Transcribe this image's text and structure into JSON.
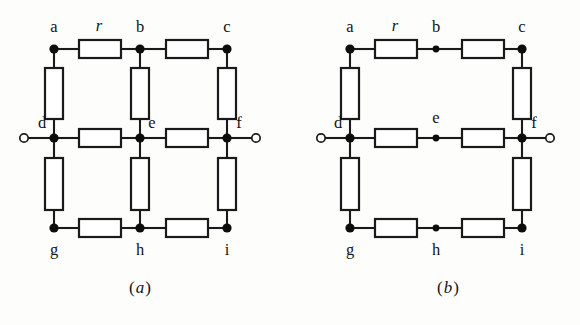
{
  "figure": {
    "background_color": "#fdfdfb",
    "line_color": "#1a1a1a",
    "resistor_fill": "#ffffff",
    "node_color": "#0d0d0d"
  },
  "resistor_label": "r",
  "panels": [
    {
      "id": "a",
      "caption_open": "(",
      "caption_letter": "a",
      "caption_close": ")",
      "description": "Nine-node resistor grid with all twelve resistors present, terminals at d and f",
      "node_labels": [
        "a",
        "b",
        "c",
        "d",
        "e",
        "f",
        "g",
        "h",
        "i"
      ],
      "nodes": [
        {
          "name": "a",
          "label": "a",
          "x": 54,
          "y": 49,
          "label_x": 54,
          "label_y": 32,
          "dot_r": 4.6
        },
        {
          "name": "b",
          "label": "b",
          "x": 140,
          "y": 49,
          "label_x": 140,
          "label_y": 32,
          "dot_r": 4.6
        },
        {
          "name": "c",
          "label": "c",
          "x": 227,
          "y": 49,
          "label_x": 227,
          "label_y": 32,
          "dot_r": 4.6
        },
        {
          "name": "d",
          "label": "d",
          "x": 54,
          "y": 138,
          "label_x": 42,
          "label_y": 128,
          "dot_r": 4.6
        },
        {
          "name": "e",
          "label": "e",
          "x": 140,
          "y": 138,
          "label_x": 152,
          "label_y": 128,
          "dot_r": 4.6
        },
        {
          "name": "f",
          "label": "f",
          "x": 227,
          "y": 138,
          "label_x": 239,
          "label_y": 128,
          "dot_r": 4.6
        },
        {
          "name": "g",
          "label": "g",
          "x": 54,
          "y": 228,
          "label_x": 54,
          "label_y": 255,
          "dot_r": 4.6
        },
        {
          "name": "h",
          "label": "h",
          "x": 140,
          "y": 228,
          "label_x": 140,
          "label_y": 255,
          "dot_r": 4.6
        },
        {
          "name": "i",
          "label": "i",
          "x": 227,
          "y": 228,
          "label_x": 227,
          "label_y": 255,
          "dot_r": 4.6
        }
      ],
      "resistors": [
        {
          "name": "resistor-a-b",
          "orientation": "h",
          "x": 79,
          "y": 40,
          "w": 42,
          "h": 18,
          "labeled": true
        },
        {
          "name": "resistor-b-c",
          "orientation": "h",
          "x": 166,
          "y": 40,
          "w": 42,
          "h": 18,
          "labeled": false
        },
        {
          "name": "resistor-d-e",
          "orientation": "h",
          "x": 79,
          "y": 129,
          "w": 42,
          "h": 18,
          "labeled": false
        },
        {
          "name": "resistor-e-f",
          "orientation": "h",
          "x": 166,
          "y": 129,
          "w": 42,
          "h": 18,
          "labeled": false
        },
        {
          "name": "resistor-g-h",
          "orientation": "h",
          "x": 79,
          "y": 219,
          "w": 42,
          "h": 18,
          "labeled": false
        },
        {
          "name": "resistor-h-i",
          "orientation": "h",
          "x": 166,
          "y": 219,
          "w": 42,
          "h": 18,
          "labeled": false
        },
        {
          "name": "resistor-a-d",
          "orientation": "v",
          "x": 45,
          "y": 68,
          "w": 18,
          "h": 51,
          "labeled": false
        },
        {
          "name": "resistor-b-e",
          "orientation": "v",
          "x": 131,
          "y": 68,
          "w": 18,
          "h": 51,
          "labeled": false
        },
        {
          "name": "resistor-c-f",
          "orientation": "v",
          "x": 218,
          "y": 68,
          "w": 18,
          "h": 51,
          "labeled": false
        },
        {
          "name": "resistor-d-g",
          "orientation": "v",
          "x": 45,
          "y": 158,
          "w": 18,
          "h": 52,
          "labeled": false
        },
        {
          "name": "resistor-e-h",
          "orientation": "v",
          "x": 131,
          "y": 158,
          "w": 18,
          "h": 52,
          "labeled": false
        },
        {
          "name": "resistor-f-i",
          "orientation": "v",
          "x": 218,
          "y": 158,
          "w": 18,
          "h": 52,
          "labeled": false
        }
      ],
      "wires": [
        {
          "name": "wire-a-to-res-ab",
          "x1": 54,
          "y1": 49,
          "x2": 79,
          "y2": 49
        },
        {
          "name": "wire-res-ab-to-b",
          "x1": 121,
          "y1": 49,
          "x2": 140,
          "y2": 49
        },
        {
          "name": "wire-b-to-res-bc",
          "x1": 140,
          "y1": 49,
          "x2": 166,
          "y2": 49
        },
        {
          "name": "wire-res-bc-to-c",
          "x1": 208,
          "y1": 49,
          "x2": 227,
          "y2": 49
        },
        {
          "name": "wire-d-to-res-de",
          "x1": 54,
          "y1": 138,
          "x2": 79,
          "y2": 138
        },
        {
          "name": "wire-res-de-to-e",
          "x1": 121,
          "y1": 138,
          "x2": 140,
          "y2": 138
        },
        {
          "name": "wire-e-to-res-ef",
          "x1": 140,
          "y1": 138,
          "x2": 166,
          "y2": 138
        },
        {
          "name": "wire-res-ef-to-f",
          "x1": 208,
          "y1": 138,
          "x2": 227,
          "y2": 138
        },
        {
          "name": "wire-g-to-res-gh",
          "x1": 54,
          "y1": 228,
          "x2": 79,
          "y2": 228
        },
        {
          "name": "wire-res-gh-to-h",
          "x1": 121,
          "y1": 228,
          "x2": 140,
          "y2": 228
        },
        {
          "name": "wire-h-to-res-hi",
          "x1": 140,
          "y1": 228,
          "x2": 166,
          "y2": 228
        },
        {
          "name": "wire-res-hi-to-i",
          "x1": 208,
          "y1": 228,
          "x2": 227,
          "y2": 228
        },
        {
          "name": "wire-a-to-res-ad",
          "x1": 54,
          "y1": 49,
          "x2": 54,
          "y2": 68
        },
        {
          "name": "wire-res-ad-to-d",
          "x1": 54,
          "y1": 119,
          "x2": 54,
          "y2": 138
        },
        {
          "name": "wire-b-to-res-be",
          "x1": 140,
          "y1": 49,
          "x2": 140,
          "y2": 68
        },
        {
          "name": "wire-res-be-to-e",
          "x1": 140,
          "y1": 119,
          "x2": 140,
          "y2": 138
        },
        {
          "name": "wire-c-to-res-cf",
          "x1": 227,
          "y1": 49,
          "x2": 227,
          "y2": 68
        },
        {
          "name": "wire-res-cf-to-f",
          "x1": 227,
          "y1": 119,
          "x2": 227,
          "y2": 138
        },
        {
          "name": "wire-d-to-res-dg",
          "x1": 54,
          "y1": 138,
          "x2": 54,
          "y2": 158
        },
        {
          "name": "wire-res-dg-to-g",
          "x1": 54,
          "y1": 210,
          "x2": 54,
          "y2": 228
        },
        {
          "name": "wire-e-to-res-eh",
          "x1": 140,
          "y1": 138,
          "x2": 140,
          "y2": 158
        },
        {
          "name": "wire-res-eh-to-h",
          "x1": 140,
          "y1": 210,
          "x2": 140,
          "y2": 228
        },
        {
          "name": "wire-f-to-res-fi",
          "x1": 227,
          "y1": 138,
          "x2": 227,
          "y2": 158
        },
        {
          "name": "wire-res-fi-to-i",
          "x1": 227,
          "y1": 210,
          "x2": 227,
          "y2": 228
        },
        {
          "name": "wire-left-terminal-lead",
          "x1": 28,
          "y1": 138,
          "x2": 54,
          "y2": 138
        },
        {
          "name": "wire-right-terminal-lead",
          "x1": 227,
          "y1": 138,
          "x2": 252,
          "y2": 138
        }
      ],
      "terminals": [
        {
          "name": "terminal-left",
          "x": 24,
          "y": 138,
          "r": 4.2
        },
        {
          "name": "terminal-right",
          "x": 256,
          "y": 138,
          "r": 4.2
        }
      ],
      "r_label_x": 99,
      "r_label_y": 31,
      "caption_x": 140,
      "caption_y": 293
    },
    {
      "id": "b",
      "caption_open": "(",
      "caption_letter": "b",
      "caption_close": ")",
      "description": "Reduced network: the three middle-column resistors are removed, nodes b, e and h are plain junctions",
      "node_labels": [
        "a",
        "b",
        "c",
        "d",
        "e",
        "f",
        "g",
        "h",
        "i"
      ],
      "nodes": [
        {
          "name": "a",
          "label": "a",
          "x": 350,
          "y": 49,
          "label_x": 350,
          "label_y": 32,
          "dot_r": 4.6
        },
        {
          "name": "b",
          "label": "b",
          "x": 436,
          "y": 49,
          "label_x": 436,
          "label_y": 32,
          "dot_r": 3.4
        },
        {
          "name": "c",
          "label": "c",
          "x": 522,
          "y": 49,
          "label_x": 522,
          "label_y": 32,
          "dot_r": 4.6
        },
        {
          "name": "d",
          "label": "d",
          "x": 350,
          "y": 138,
          "label_x": 338,
          "label_y": 128,
          "dot_r": 4.6
        },
        {
          "name": "e",
          "label": "e",
          "x": 436,
          "y": 138,
          "label_x": 436,
          "label_y": 123,
          "dot_r": 3.4
        },
        {
          "name": "f",
          "label": "f",
          "x": 522,
          "y": 138,
          "label_x": 534,
          "label_y": 128,
          "dot_r": 4.6
        },
        {
          "name": "g",
          "label": "g",
          "x": 350,
          "y": 228,
          "label_x": 350,
          "label_y": 255,
          "dot_r": 4.6
        },
        {
          "name": "h",
          "label": "h",
          "x": 436,
          "y": 228,
          "label_x": 436,
          "label_y": 255,
          "dot_r": 3.4
        },
        {
          "name": "i",
          "label": "i",
          "x": 522,
          "y": 228,
          "label_x": 522,
          "label_y": 255,
          "dot_r": 4.6
        }
      ],
      "resistors": [
        {
          "name": "resistor-a-b",
          "orientation": "h",
          "x": 375,
          "y": 40,
          "w": 42,
          "h": 18,
          "labeled": true
        },
        {
          "name": "resistor-b-c",
          "orientation": "h",
          "x": 462,
          "y": 40,
          "w": 42,
          "h": 18,
          "labeled": false
        },
        {
          "name": "resistor-d-e",
          "orientation": "h",
          "x": 375,
          "y": 129,
          "w": 42,
          "h": 18,
          "labeled": false
        },
        {
          "name": "resistor-e-f",
          "orientation": "h",
          "x": 462,
          "y": 129,
          "w": 42,
          "h": 18,
          "labeled": false
        },
        {
          "name": "resistor-g-h",
          "orientation": "h",
          "x": 375,
          "y": 219,
          "w": 42,
          "h": 18,
          "labeled": false
        },
        {
          "name": "resistor-h-i",
          "orientation": "h",
          "x": 462,
          "y": 219,
          "w": 42,
          "h": 18,
          "labeled": false
        },
        {
          "name": "resistor-a-d",
          "orientation": "v",
          "x": 341,
          "y": 68,
          "w": 18,
          "h": 51,
          "labeled": false
        },
        {
          "name": "resistor-c-f",
          "orientation": "v",
          "x": 513,
          "y": 68,
          "w": 18,
          "h": 51,
          "labeled": false
        },
        {
          "name": "resistor-d-g",
          "orientation": "v",
          "x": 341,
          "y": 158,
          "w": 18,
          "h": 52,
          "labeled": false
        },
        {
          "name": "resistor-f-i",
          "orientation": "v",
          "x": 513,
          "y": 158,
          "w": 18,
          "h": 52,
          "labeled": false
        }
      ],
      "wires": [
        {
          "name": "wire-a-to-res-ab",
          "x1": 350,
          "y1": 49,
          "x2": 375,
          "y2": 49
        },
        {
          "name": "wire-res-ab-to-b",
          "x1": 417,
          "y1": 49,
          "x2": 436,
          "y2": 49
        },
        {
          "name": "wire-b-to-res-bc",
          "x1": 436,
          "y1": 49,
          "x2": 462,
          "y2": 49
        },
        {
          "name": "wire-res-bc-to-c",
          "x1": 504,
          "y1": 49,
          "x2": 522,
          "y2": 49
        },
        {
          "name": "wire-d-to-res-de",
          "x1": 350,
          "y1": 138,
          "x2": 375,
          "y2": 138
        },
        {
          "name": "wire-res-de-to-e",
          "x1": 417,
          "y1": 138,
          "x2": 436,
          "y2": 138
        },
        {
          "name": "wire-e-to-res-ef",
          "x1": 436,
          "y1": 138,
          "x2": 462,
          "y2": 138
        },
        {
          "name": "wire-res-ef-to-f",
          "x1": 504,
          "y1": 138,
          "x2": 522,
          "y2": 138
        },
        {
          "name": "wire-g-to-res-gh",
          "x1": 350,
          "y1": 228,
          "x2": 375,
          "y2": 228
        },
        {
          "name": "wire-res-gh-to-h",
          "x1": 417,
          "y1": 228,
          "x2": 436,
          "y2": 228
        },
        {
          "name": "wire-h-to-res-hi",
          "x1": 436,
          "y1": 228,
          "x2": 462,
          "y2": 228
        },
        {
          "name": "wire-res-hi-to-i",
          "x1": 504,
          "y1": 228,
          "x2": 522,
          "y2": 228
        },
        {
          "name": "wire-a-to-res-ad",
          "x1": 350,
          "y1": 49,
          "x2": 350,
          "y2": 68
        },
        {
          "name": "wire-res-ad-to-d",
          "x1": 350,
          "y1": 119,
          "x2": 350,
          "y2": 138
        },
        {
          "name": "wire-c-to-res-cf",
          "x1": 522,
          "y1": 49,
          "x2": 522,
          "y2": 68
        },
        {
          "name": "wire-res-cf-to-f",
          "x1": 522,
          "y1": 119,
          "x2": 522,
          "y2": 138
        },
        {
          "name": "wire-d-to-res-dg",
          "x1": 350,
          "y1": 138,
          "x2": 350,
          "y2": 158
        },
        {
          "name": "wire-res-dg-to-g",
          "x1": 350,
          "y1": 210,
          "x2": 350,
          "y2": 228
        },
        {
          "name": "wire-f-to-res-fi",
          "x1": 522,
          "y1": 138,
          "x2": 522,
          "y2": 158
        },
        {
          "name": "wire-res-fi-to-i",
          "x1": 522,
          "y1": 210,
          "x2": 522,
          "y2": 228
        },
        {
          "name": "wire-left-terminal-lead",
          "x1": 325,
          "y1": 138,
          "x2": 350,
          "y2": 138
        },
        {
          "name": "wire-right-terminal-lead",
          "x1": 522,
          "y1": 138,
          "x2": 546,
          "y2": 138
        }
      ],
      "terminals": [
        {
          "name": "terminal-left",
          "x": 321,
          "y": 138,
          "r": 4.2
        },
        {
          "name": "terminal-right",
          "x": 550,
          "y": 138,
          "r": 4.2
        }
      ],
      "r_label_x": 395,
      "r_label_y": 31,
      "caption_x": 448,
      "caption_y": 293
    }
  ]
}
